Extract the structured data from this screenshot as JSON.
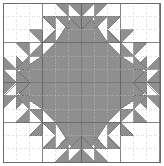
{
  "canvas": {
    "width": 164,
    "height": 166,
    "background_color": "#ffffff",
    "title": "Quilt Block Pattern"
  },
  "border": {
    "color": "#6b6b6b",
    "width": 1,
    "x": 3,
    "y": 3,
    "w": 157,
    "h": 159
  },
  "grid": {
    "columns": 12,
    "rows": 12,
    "origin_x": 3,
    "origin_y": 3,
    "cell_w": 13.083,
    "cell_h": 13.25,
    "major_line_color": "#9a9a9a",
    "minor_line_color": "#c9c9c9",
    "minor_dash": "1,1.6",
    "major_every": 3,
    "visible": true
  },
  "palette": {
    "fill_gray": "#8f8f8f",
    "fill_gray_alt": "#999999",
    "outline_gray": "#6b6b6b",
    "white": "#ffffff"
  },
  "shapes": {
    "center_block": {
      "name": "center-octagon-block",
      "description": "Solid gray octagonal medallion at center of grid",
      "points_grid": "3,4 4,3 8,3 9,4 9,8 8,9 4,9 3,8"
    },
    "arms": [
      {
        "name": "arm-top",
        "points_grid": "4,3 5.2,1.2 6,2 6.8,1.2 8,3"
      },
      {
        "name": "arm-bottom",
        "points_grid": "4,9 5.2,10.8 6,10 6.8,10.8 8,9"
      },
      {
        "name": "arm-left",
        "points_grid": "3,4 1.2,5.2 2,6 1.2,6.8 3,8"
      },
      {
        "name": "arm-right",
        "points_grid": "9,4 10.8,5.2 10,6 10.8,6.8 9,8"
      }
    ],
    "sawtooth_rows": [
      {
        "name": "sawtooth-top-outer",
        "edge": "top",
        "band": 0,
        "teeth": 4,
        "start_col": 4
      },
      {
        "name": "sawtooth-top-inner",
        "edge": "top",
        "band": 1,
        "teeth": 4,
        "start_col": 4
      },
      {
        "name": "sawtooth-bottom-outer",
        "edge": "bottom",
        "band": 0,
        "teeth": 4,
        "start_col": 4
      },
      {
        "name": "sawtooth-bottom-inner",
        "edge": "bottom",
        "band": 1,
        "teeth": 4,
        "start_col": 4
      },
      {
        "name": "sawtooth-left-outer",
        "edge": "left",
        "band": 0,
        "teeth": 4,
        "start_row": 4
      },
      {
        "name": "sawtooth-left-inner",
        "edge": "left",
        "band": 1,
        "teeth": 4,
        "start_row": 4
      },
      {
        "name": "sawtooth-right-outer",
        "edge": "right",
        "band": 0,
        "teeth": 4,
        "start_row": 4
      },
      {
        "name": "sawtooth-right-inner",
        "edge": "right",
        "band": 1,
        "teeth": 4,
        "start_row": 4
      }
    ],
    "corner_clusters": [
      {
        "name": "corner-cluster-top-left",
        "corner": "tl"
      },
      {
        "name": "corner-cluster-top-right",
        "corner": "tr"
      },
      {
        "name": "corner-cluster-bottom-left",
        "corner": "bl"
      },
      {
        "name": "corner-cluster-bottom-right",
        "corner": "br"
      }
    ]
  },
  "labels": {
    "figure_caption": ""
  }
}
